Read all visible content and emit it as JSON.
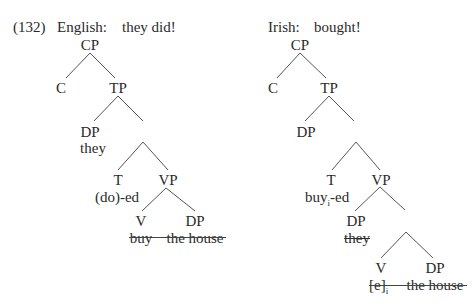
{
  "example_number": "(132)",
  "english": {
    "label": "English:",
    "gloss": "they did!",
    "nodes": {
      "cp": "CP",
      "c": "C",
      "tp": "TP",
      "dp_subject": "DP",
      "subject_word": "they",
      "t": "T",
      "t_word": "(do)-ed",
      "vp": "VP",
      "v": "V",
      "dp_object": "DP",
      "v_word": "buy",
      "object_word": "the house"
    }
  },
  "irish": {
    "label": "Irish:",
    "gloss": "bought!",
    "nodes": {
      "cp": "CP",
      "c": "C",
      "tp": "TP",
      "dp_spec_tp": "DP",
      "t": "T",
      "t_word": "buy",
      "t_index": "i",
      "t_suffix": "-ed",
      "vp": "VP",
      "dp_subject": "DP",
      "subject_word": "they",
      "v": "V",
      "dp_object": "DP",
      "v_word": "[e]",
      "v_index": "i",
      "object_word": "the house"
    }
  },
  "colors": {
    "text": "#2a2a2a",
    "lines": "#555555",
    "background": "#ffffff"
  }
}
